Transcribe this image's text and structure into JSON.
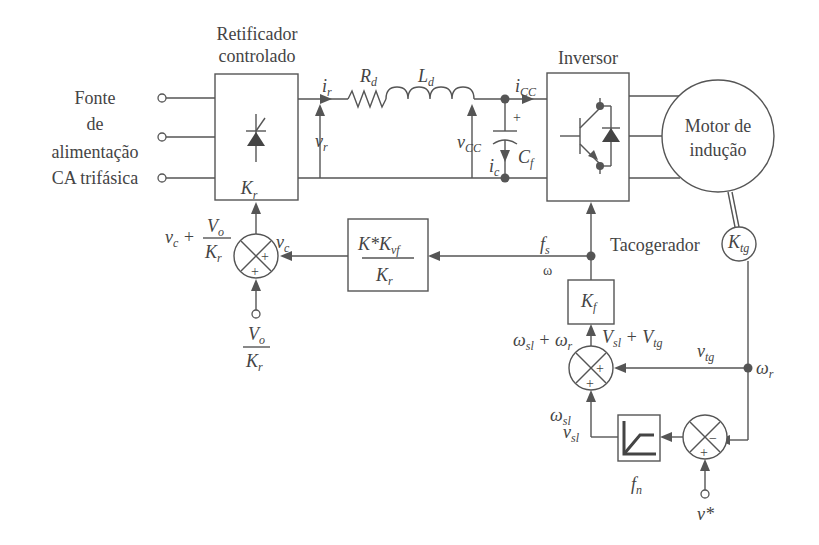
{
  "diagram": {
    "source": {
      "lines": [
        "Fonte",
        "de",
        "alimentação",
        "CA trifásica"
      ]
    },
    "rectifier": {
      "title_lines": [
        "Retificador",
        "controlado"
      ],
      "gain": "K",
      "gain_sub": "r"
    },
    "dc_link": {
      "ir": "i",
      "ir_sub": "r",
      "Rd": "R",
      "Rd_sub": "d",
      "Ld": "L",
      "Ld_sub": "d",
      "vr": "v",
      "vr_sub": "r",
      "vcc": "v",
      "vcc_sub": "CC",
      "icc": "i",
      "icc_sub": "CC",
      "ic": "i",
      "ic_sub": "c",
      "Cf": "C",
      "Cf_sub": "f",
      "plus": "+"
    },
    "inverter": {
      "title": "Inversor"
    },
    "motor": {
      "lines": [
        "Motor de",
        "indução"
      ]
    },
    "tacho": {
      "label": "Tacogerador",
      "gain": "K",
      "gain_sub": "tg"
    },
    "vf_block": {
      "num": "K*K",
      "num_sub": "vf",
      "den": "K",
      "den_sub": "r"
    },
    "kf_block": {
      "gain": "K",
      "gain_sub": "f"
    },
    "fn_block": {
      "label": "f",
      "label_sub": "n"
    },
    "signals": {
      "fs": "f",
      "fs_sub": "s",
      "omega": "ω",
      "vc": "v",
      "vc_sub": "c",
      "vc_sum": "v",
      "vc_sum_sub": "c",
      "plus_sign": "+",
      "Vo": "V",
      "Vo_sub": "o",
      "Kr": "K",
      "Kr_sub": "r",
      "wsl_wr": "ω",
      "wsl_wr_label": "sl",
      "wr": "ω",
      "wr_sub": "r",
      "Vsl": "V",
      "Vsl_sub": "sl",
      "Vtg": "V",
      "Vtg_sub": "tg",
      "vtg": "v",
      "vtg_sub": "tg",
      "wsl": "ω",
      "wsl_sub": "sl",
      "vsl": "v",
      "vsl_sub": "sl",
      "vstar": "v*"
    },
    "summers": {
      "plus": "+",
      "minus": "−"
    }
  }
}
